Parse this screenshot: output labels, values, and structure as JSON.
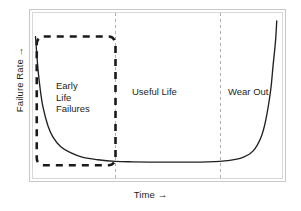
{
  "figure": {
    "background_color": "#ffffff",
    "frame_color": "#c9c9c9",
    "curve_color": "#231f20",
    "divider_color": "#b0b0b0",
    "highlight_box_color": "#1a1a1a"
  },
  "axes": {
    "y_label": "Failure Rate →",
    "x_label": "Time →"
  },
  "regions": [
    {
      "id": "early-life-failures",
      "label": "Early\nLife\nFailures"
    },
    {
      "id": "useful-life",
      "label": "Useful Life"
    },
    {
      "id": "wear-out",
      "label": "Wear Out"
    }
  ],
  "chart_data": {
    "type": "line",
    "xlabel": "Time →",
    "ylabel": "Failure Rate →",
    "xlim": [
      0,
      100
    ],
    "ylim": [
      0,
      100
    ],
    "grid": false,
    "legend": "none",
    "axis_ticks": {
      "x": [],
      "y": []
    },
    "annotations": [
      {
        "text": "Early Life Failures",
        "x": 13,
        "y": 52
      },
      {
        "text": "Useful Life",
        "x": 45,
        "y": 48
      },
      {
        "text": "Wear Out",
        "x": 82,
        "y": 48
      }
    ],
    "region_dividers_x": [
      33,
      75
    ],
    "highlight_box": {
      "label": "Early Life Failures zone",
      "x0": 1.5,
      "x1": 33,
      "y0": 3,
      "y1": 85,
      "style": "dashed"
    },
    "series": [
      {
        "name": "Failure Rate",
        "style": "solid",
        "x": [
          1,
          2,
          3,
          4,
          6,
          8,
          11,
          15,
          20,
          26,
          33,
          40,
          50,
          60,
          70,
          78,
          84,
          88,
          91,
          93,
          95,
          96,
          97,
          97.5
        ],
        "y": [
          85,
          64,
          50,
          40,
          28,
          21,
          15,
          11,
          8,
          6.5,
          5.5,
          5.2,
          5.0,
          5.0,
          5.2,
          6.0,
          8.0,
          12,
          20,
          31,
          50,
          66,
          82,
          95
        ]
      }
    ]
  }
}
